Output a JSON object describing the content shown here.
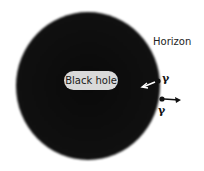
{
  "diagram": {
    "labels": {
      "black_hole": "Black hole",
      "horizon": "Horizon",
      "particle_in": "γ",
      "particle_out": "γ"
    },
    "elements": {
      "black_hole": {
        "cx": 88,
        "cy": 86,
        "r": 72,
        "color": "#0a0a0a"
      },
      "particle_in": {
        "x": 158,
        "y": 81,
        "arrow_direction": "inward",
        "arrow_color": "#ffffff"
      },
      "particle_out": {
        "x": 161,
        "y": 99,
        "arrow_direction": "outward",
        "arrow_color": "#111111"
      }
    },
    "colors": {
      "background": "#ffffff",
      "bubble": "#d9d9d9",
      "text": "#222222"
    }
  }
}
